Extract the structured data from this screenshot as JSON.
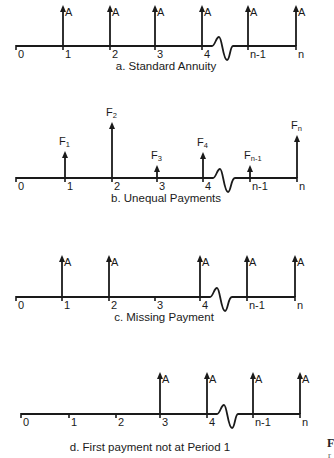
{
  "figure": {
    "line_color": "#1a1a1a",
    "break_label": "time-axis-break",
    "panels": [
      {
        "id": "a",
        "caption": "a. Standard Annuity",
        "axis_y": 46,
        "caption_y": 66,
        "ticks": [
          {
            "label": "0",
            "x": 16
          },
          {
            "label": "1",
            "x": 63
          },
          {
            "label": "2",
            "x": 110
          },
          {
            "label": "3",
            "x": 155
          },
          {
            "label": "4",
            "x": 202
          },
          {
            "label": "n-1",
            "x": 248
          },
          {
            "label": "n",
            "x": 296
          }
        ],
        "arrows": [
          {
            "x": 63,
            "top": 5,
            "label": "A",
            "sub": ""
          },
          {
            "x": 110,
            "top": 5,
            "label": "A",
            "sub": ""
          },
          {
            "x": 155,
            "top": 5,
            "label": "A",
            "sub": ""
          },
          {
            "x": 202,
            "top": 5,
            "label": "A",
            "sub": ""
          },
          {
            "x": 248,
            "top": 5,
            "label": "A",
            "sub": ""
          },
          {
            "x": 296,
            "top": 5,
            "label": "A",
            "sub": ""
          }
        ],
        "label_style": "side"
      },
      {
        "id": "b",
        "caption": "b. Unequal Payments",
        "axis_y": 178,
        "caption_y": 198,
        "ticks": [
          {
            "label": "0",
            "x": 16
          },
          {
            "label": "1",
            "x": 65
          },
          {
            "label": "2",
            "x": 112
          },
          {
            "label": "3",
            "x": 157
          },
          {
            "label": "4",
            "x": 203
          },
          {
            "label": "n-1",
            "x": 250
          },
          {
            "label": "n",
            "x": 297
          }
        ],
        "arrows": [
          {
            "x": 65,
            "top": 151,
            "label": "F",
            "sub": "1"
          },
          {
            "x": 112,
            "top": 122,
            "label": "F",
            "sub": "2"
          },
          {
            "x": 157,
            "top": 165,
            "label": "F",
            "sub": "3"
          },
          {
            "x": 203,
            "top": 152,
            "label": "F",
            "sub": "4"
          },
          {
            "x": 250,
            "top": 165,
            "label": "F",
            "sub": "n-1"
          },
          {
            "x": 297,
            "top": 135,
            "label": "F",
            "sub": "n"
          }
        ],
        "label_style": "above"
      },
      {
        "id": "c",
        "caption": "c. Missing Payment",
        "axis_y": 297,
        "caption_y": 318,
        "ticks": [
          {
            "label": "0",
            "x": 16
          },
          {
            "label": "1",
            "x": 62
          },
          {
            "label": "2",
            "x": 109
          },
          {
            "label": "3",
            "x": 155
          },
          {
            "label": "4",
            "x": 200
          },
          {
            "label": "n-1",
            "x": 247
          },
          {
            "label": "n",
            "x": 295
          }
        ],
        "arrows": [
          {
            "x": 62,
            "top": 255,
            "label": "A",
            "sub": ""
          },
          {
            "x": 109,
            "top": 255,
            "label": "A",
            "sub": ""
          },
          {
            "x": 200,
            "top": 255,
            "label": "A",
            "sub": ""
          },
          {
            "x": 247,
            "top": 255,
            "label": "A",
            "sub": ""
          },
          {
            "x": 295,
            "top": 255,
            "label": "A",
            "sub": ""
          }
        ],
        "label_style": "side"
      },
      {
        "id": "d",
        "caption": "d. First payment not at Period 1",
        "axis_y": 414,
        "caption_y": 447,
        "ticks": [
          {
            "label": "0",
            "x": 21
          },
          {
            "label": "1",
            "x": 69
          },
          {
            "label": "2",
            "x": 116
          },
          {
            "label": "3",
            "x": 160
          },
          {
            "label": "4",
            "x": 207
          },
          {
            "label": "n-1",
            "x": 253
          },
          {
            "label": "n",
            "x": 300
          }
        ],
        "arrows": [
          {
            "x": 160,
            "top": 372,
            "label": "A",
            "sub": ""
          },
          {
            "x": 207,
            "top": 372,
            "label": "A",
            "sub": ""
          },
          {
            "x": 253,
            "top": 372,
            "label": "A",
            "sub": ""
          },
          {
            "x": 300,
            "top": 372,
            "label": "A",
            "sub": ""
          }
        ],
        "label_style": "side"
      }
    ]
  },
  "corner_text": {
    "line1": "F",
    "line2": "r"
  }
}
